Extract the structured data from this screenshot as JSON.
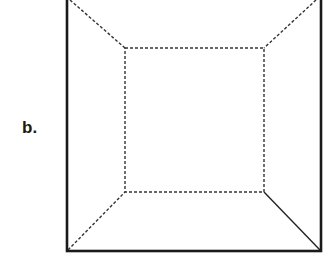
{
  "figure": {
    "label": "b.",
    "outer_square": {
      "x1": 67,
      "y1": -2,
      "x2": 321,
      "y2": 251,
      "stroke": "#1a1a1a",
      "style": "solid"
    },
    "inner_square": {
      "x1": 125,
      "y1": 48,
      "x2": 264,
      "y2": 192,
      "stroke": "#333333",
      "style": "dashed"
    },
    "connectors": [
      {
        "from": "outer-top-left",
        "to": "inner-top-left",
        "style": "dashed"
      },
      {
        "from": "outer-top-right",
        "to": "inner-top-right",
        "style": "dashed"
      },
      {
        "from": "outer-bottom-left",
        "to": "inner-bottom-left",
        "style": "dashed"
      },
      {
        "from": "outer-bottom-right",
        "to": "inner-bottom-right",
        "style": "solid"
      }
    ]
  }
}
